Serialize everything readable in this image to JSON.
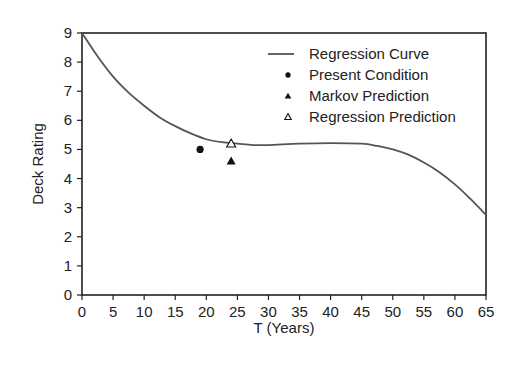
{
  "chart_data": {
    "type": "line",
    "title": "",
    "xlabel": "T (Years)",
    "ylabel": "Deck Rating",
    "xlim": [
      0,
      65
    ],
    "ylim": [
      0,
      9
    ],
    "xticks": [
      0,
      5,
      10,
      15,
      20,
      25,
      30,
      35,
      40,
      45,
      50,
      55,
      60,
      65
    ],
    "yticks": [
      0,
      1,
      2,
      3,
      4,
      5,
      6,
      7,
      8,
      9
    ],
    "grid": false,
    "legend_position": "upper right",
    "series": [
      {
        "name": "Regression Curve",
        "type": "line",
        "color": "#555555",
        "x": [
          0,
          2.5,
          5,
          7.5,
          10,
          12.5,
          15,
          17.5,
          20,
          22.5,
          25,
          27.5,
          30,
          35,
          40,
          45,
          47.5,
          50,
          52.5,
          55,
          57.5,
          60,
          62.5,
          65
        ],
        "y": [
          9.0,
          8.2,
          7.5,
          6.95,
          6.5,
          6.1,
          5.8,
          5.55,
          5.35,
          5.25,
          5.2,
          5.15,
          5.15,
          5.2,
          5.22,
          5.2,
          5.12,
          5.0,
          4.82,
          4.55,
          4.22,
          3.8,
          3.3,
          2.75
        ]
      },
      {
        "name": "Present Condition",
        "type": "scatter",
        "marker": "filled-circle",
        "color": "#111111",
        "x": [
          19
        ],
        "y": [
          5.0
        ]
      },
      {
        "name": "Markov Prediction",
        "type": "scatter",
        "marker": "filled-triangle",
        "color": "#111111",
        "x": [
          24
        ],
        "y": [
          4.6
        ]
      },
      {
        "name": "Regression Prediction",
        "type": "scatter",
        "marker": "open-triangle",
        "color": "#111111",
        "x": [
          24
        ],
        "y": [
          5.2
        ]
      }
    ]
  },
  "legend": {
    "items": [
      {
        "label": "Regression Curve",
        "symbol": "line"
      },
      {
        "label": "Present Condition",
        "symbol": "filled-circle"
      },
      {
        "label": "Markov Prediction",
        "symbol": "filled-triangle"
      },
      {
        "label": "Regression Prediction",
        "symbol": "open-triangle"
      }
    ]
  },
  "axes": {
    "x_title": "T (Years)",
    "y_title": "Deck Rating"
  }
}
